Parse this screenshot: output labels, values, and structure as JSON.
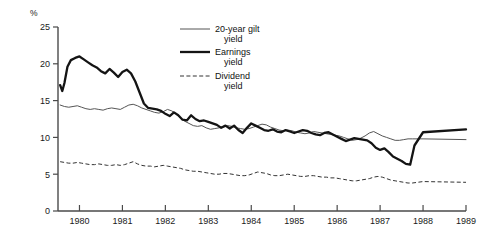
{
  "chart_data": {
    "type": "line",
    "title": "",
    "xlabel": "",
    "ylabel": "%",
    "yunit": "%",
    "xlim": [
      1979.5,
      1989.0
    ],
    "ylim": [
      0,
      25
    ],
    "grid": false,
    "legend_position": "top-right",
    "yticks": [
      0,
      5,
      10,
      15,
      20,
      25
    ],
    "ytick_labels": [
      "0",
      "5",
      "10",
      "15",
      "20",
      "25"
    ],
    "xticks": [
      1980,
      1981,
      1982,
      1983,
      1984,
      1985,
      1986,
      1987,
      1988,
      1989
    ],
    "xtick_labels": [
      "1980",
      "1981",
      "1982",
      "1983",
      "1984",
      "1985",
      "1986",
      "1987",
      "1988",
      "1989"
    ],
    "series": [
      {
        "name": "20-year gilt yield",
        "style": "thin-solid",
        "color": "#555555",
        "x": [
          1979.55,
          1979.65,
          1979.75,
          1979.85,
          1979.95,
          1980.05,
          1980.15,
          1980.25,
          1980.35,
          1980.45,
          1980.55,
          1980.65,
          1980.75,
          1980.85,
          1980.95,
          1981.05,
          1981.15,
          1981.25,
          1981.35,
          1981.45,
          1981.55,
          1981.65,
          1981.75,
          1981.85,
          1981.95,
          1982.05,
          1982.15,
          1982.25,
          1982.35,
          1982.45,
          1982.55,
          1982.65,
          1982.75,
          1982.85,
          1982.95,
          1983.05,
          1983.15,
          1983.25,
          1983.35,
          1983.45,
          1983.55,
          1983.65,
          1983.75,
          1983.85,
          1983.95,
          1984.05,
          1984.15,
          1984.25,
          1984.35,
          1984.45,
          1984.55,
          1984.65,
          1984.75,
          1984.85,
          1984.95,
          1985.05,
          1985.15,
          1985.25,
          1985.35,
          1985.45,
          1985.55,
          1985.65,
          1985.75,
          1985.85,
          1985.95,
          1986.05,
          1986.15,
          1986.25,
          1986.35,
          1986.45,
          1986.55,
          1986.65,
          1986.75,
          1986.85,
          1986.95,
          1987.05,
          1987.15,
          1987.25,
          1987.35,
          1987.45,
          1987.55,
          1987.65,
          1987.75,
          1988.0,
          1989.0
        ],
        "values": [
          14.4,
          14.2,
          14.1,
          14.2,
          14.3,
          14.1,
          13.9,
          13.8,
          13.9,
          13.8,
          13.7,
          13.9,
          14.0,
          13.9,
          13.8,
          14.1,
          14.4,
          14.5,
          14.3,
          14.0,
          13.8,
          13.6,
          13.4,
          13.3,
          13.5,
          13.8,
          13.6,
          13.2,
          12.6,
          12.2,
          11.9,
          11.6,
          11.5,
          11.6,
          11.3,
          11.1,
          11.2,
          11.3,
          11.5,
          11.6,
          11.5,
          11.3,
          11.2,
          11.1,
          11.2,
          11.4,
          11.6,
          11.8,
          11.7,
          11.4,
          11.2,
          11.0,
          10.9,
          11.0,
          10.9,
          10.7,
          10.6,
          10.5,
          10.6,
          10.8,
          10.7,
          10.6,
          10.5,
          10.4,
          10.3,
          10.2,
          10.0,
          9.8,
          9.6,
          9.7,
          9.9,
          10.2,
          10.6,
          10.8,
          10.5,
          10.2,
          10.0,
          9.8,
          9.6,
          9.6,
          9.7,
          9.8,
          9.8,
          9.8,
          9.7
        ]
      },
      {
        "name": "Earnings yield",
        "style": "thick-solid",
        "color": "#141414",
        "x": [
          1979.55,
          1979.6,
          1979.65,
          1979.72,
          1979.8,
          1979.9,
          1980.0,
          1980.1,
          1980.2,
          1980.3,
          1980.4,
          1980.5,
          1980.6,
          1980.7,
          1980.8,
          1980.9,
          1981.0,
          1981.1,
          1981.2,
          1981.3,
          1981.4,
          1981.5,
          1981.6,
          1981.7,
          1981.8,
          1981.9,
          1982.0,
          1982.1,
          1982.2,
          1982.3,
          1982.4,
          1982.5,
          1982.6,
          1982.7,
          1982.8,
          1982.9,
          1983.0,
          1983.1,
          1983.2,
          1983.3,
          1983.4,
          1983.5,
          1983.6,
          1983.7,
          1983.8,
          1983.9,
          1984.0,
          1984.1,
          1984.2,
          1984.3,
          1984.4,
          1984.5,
          1984.6,
          1984.7,
          1984.8,
          1984.9,
          1985.0,
          1985.1,
          1985.2,
          1985.3,
          1985.4,
          1985.5,
          1985.6,
          1985.7,
          1985.8,
          1985.9,
          1986.0,
          1986.1,
          1986.2,
          1986.3,
          1986.4,
          1986.5,
          1986.6,
          1986.7,
          1986.8,
          1986.9,
          1987.0,
          1987.1,
          1987.2,
          1987.3,
          1987.4,
          1987.5,
          1987.6,
          1987.7,
          1987.8,
          1988.0,
          1989.0
        ],
        "values": [
          17.1,
          16.3,
          17.4,
          19.6,
          20.5,
          20.8,
          21.0,
          20.6,
          20.2,
          19.8,
          19.5,
          19.0,
          18.7,
          19.3,
          18.8,
          18.2,
          18.9,
          19.2,
          18.7,
          17.6,
          16.1,
          14.6,
          14.0,
          13.9,
          13.8,
          13.6,
          13.2,
          12.9,
          13.4,
          13.0,
          12.4,
          12.3,
          13.0,
          12.5,
          12.2,
          12.3,
          12.1,
          11.9,
          11.7,
          11.3,
          11.6,
          11.2,
          11.6,
          11.0,
          10.6,
          11.3,
          11.9,
          11.6,
          11.3,
          11.0,
          10.9,
          11.1,
          10.8,
          10.7,
          11.0,
          10.8,
          10.6,
          10.8,
          11.0,
          10.9,
          10.6,
          10.4,
          10.3,
          10.6,
          10.7,
          10.4,
          10.1,
          9.8,
          9.5,
          9.7,
          9.9,
          9.8,
          9.7,
          9.6,
          9.2,
          8.6,
          8.3,
          8.5,
          8.0,
          7.4,
          7.1,
          6.8,
          6.4,
          6.3,
          8.9,
          10.7,
          11.1
        ]
      },
      {
        "name": "Dividend yield",
        "style": "dashed",
        "color": "#333333",
        "x": [
          1979.55,
          1979.65,
          1979.75,
          1979.85,
          1979.95,
          1980.05,
          1980.15,
          1980.25,
          1980.35,
          1980.45,
          1980.55,
          1980.65,
          1980.75,
          1980.85,
          1980.95,
          1981.05,
          1981.15,
          1981.25,
          1981.35,
          1981.45,
          1981.55,
          1981.65,
          1981.75,
          1981.85,
          1981.95,
          1982.05,
          1982.15,
          1982.25,
          1982.35,
          1982.45,
          1982.55,
          1982.65,
          1982.75,
          1982.85,
          1982.95,
          1983.05,
          1983.15,
          1983.25,
          1983.35,
          1983.45,
          1983.55,
          1983.65,
          1983.75,
          1983.85,
          1983.95,
          1984.05,
          1984.15,
          1984.25,
          1984.35,
          1984.45,
          1984.55,
          1984.65,
          1984.75,
          1984.85,
          1984.95,
          1985.05,
          1985.15,
          1985.25,
          1985.35,
          1985.45,
          1985.55,
          1985.65,
          1985.75,
          1985.85,
          1985.95,
          1986.05,
          1986.15,
          1986.25,
          1986.35,
          1986.45,
          1986.55,
          1986.65,
          1986.75,
          1986.85,
          1986.95,
          1987.05,
          1987.15,
          1987.25,
          1987.35,
          1987.45,
          1987.55,
          1987.65,
          1987.75,
          1988.0,
          1989.0
        ],
        "values": [
          6.7,
          6.6,
          6.5,
          6.5,
          6.6,
          6.5,
          6.4,
          6.3,
          6.3,
          6.4,
          6.3,
          6.2,
          6.2,
          6.3,
          6.2,
          6.3,
          6.5,
          6.7,
          6.4,
          6.2,
          6.1,
          6.1,
          6.0,
          6.1,
          6.2,
          6.1,
          6.0,
          5.9,
          5.8,
          5.6,
          5.5,
          5.4,
          5.4,
          5.3,
          5.2,
          5.1,
          5.0,
          5.0,
          5.1,
          5.1,
          5.0,
          4.9,
          4.8,
          4.8,
          4.9,
          5.1,
          5.3,
          5.2,
          5.1,
          4.9,
          4.8,
          4.8,
          4.9,
          5.0,
          4.9,
          4.8,
          4.7,
          4.7,
          4.8,
          4.8,
          4.7,
          4.6,
          4.6,
          4.5,
          4.5,
          4.4,
          4.3,
          4.2,
          4.1,
          4.1,
          4.2,
          4.3,
          4.4,
          4.6,
          4.7,
          4.6,
          4.4,
          4.2,
          4.1,
          4.0,
          3.9,
          3.8,
          3.8,
          4.0,
          3.9
        ]
      }
    ]
  },
  "legend": {
    "items": [
      {
        "label_line1": "20-year gilt",
        "label_line2": "yield"
      },
      {
        "label_line1": "Earnings",
        "label_line2": "yield"
      },
      {
        "label_line1": "Dividend",
        "label_line2": "yield"
      }
    ]
  }
}
